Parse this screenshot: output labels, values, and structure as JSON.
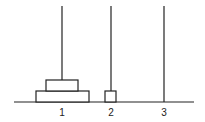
{
  "diagram": {
    "type": "tower-of-hanoi",
    "pegs": [
      {
        "label": "1",
        "x": 62,
        "disks": [
          {
            "width": 53,
            "level": 0
          },
          {
            "width": 32,
            "level": 1
          }
        ]
      },
      {
        "label": "2",
        "x": 111,
        "disks": [
          {
            "width": 11,
            "level": 0
          }
        ]
      },
      {
        "label": "3",
        "x": 164,
        "disks": []
      }
    ],
    "colors": {
      "stroke": "#222222",
      "background": "#ffffff"
    }
  }
}
